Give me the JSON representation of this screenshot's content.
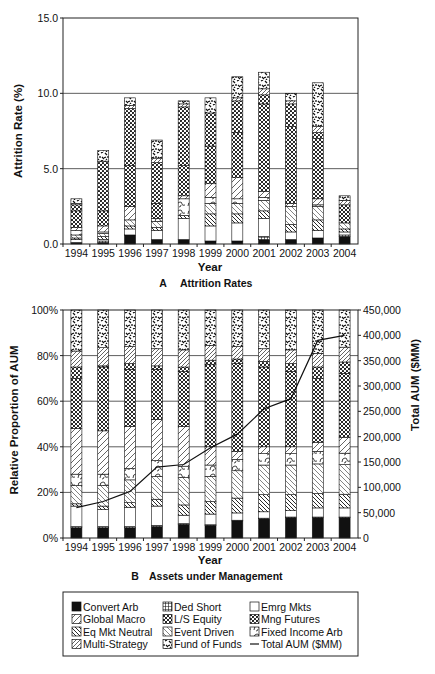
{
  "panels": {
    "a": {
      "letter": "A",
      "caption": "Attrition Rates",
      "xlabel": "Year",
      "ylabel": "Attrition Rate (%)"
    },
    "b": {
      "letter": "B",
      "caption": "Assets under Management",
      "xlabel": "Year",
      "ylabel_left": "Relative Proportion of AUM",
      "ylabel_right": "Total AUM ($MM)"
    }
  },
  "legend": {
    "items": [
      {
        "label": "Convert Arb",
        "pattern": "solid-black"
      },
      {
        "label": "Ded Short",
        "pattern": "grid"
      },
      {
        "label": "Emrg Mkts",
        "pattern": "blank"
      },
      {
        "label": "Global Macro",
        "pattern": "diag-sparse"
      },
      {
        "label": "L/S Equity",
        "pattern": "crosshatch"
      },
      {
        "label": "Mng Futures",
        "pattern": "dots"
      },
      {
        "label": "Eq Mkt Neutral",
        "pattern": "diag-back-dense"
      },
      {
        "label": "Event Driven",
        "pattern": "diag-back"
      },
      {
        "label": "Fixed Income Arb",
        "pattern": "waves"
      },
      {
        "label": "Multi-Strategy",
        "pattern": "diag-fwd"
      },
      {
        "label": "Fund of Funds",
        "pattern": "confetti"
      },
      {
        "label": "Total AUM ($MM)",
        "pattern": "line"
      }
    ]
  },
  "chart_data": [
    {
      "type": "bar",
      "stacked": true,
      "title": "A Attrition Rates",
      "xlabel": "Year",
      "ylabel": "Attrition Rate (%)",
      "ylim": [
        0,
        15
      ],
      "yticks": [
        "0.0",
        "5.0",
        "10.0",
        "15.0"
      ],
      "grid": "horizontal at 5.0 and 10.0",
      "categories": [
        "1994",
        "1995",
        "1996",
        "1997",
        "1998",
        "1999",
        "2000",
        "2001",
        "2002",
        "2003",
        "2004"
      ],
      "series": [
        {
          "name": "Convert Arb",
          "values": [
            0.1,
            0.1,
            0.6,
            0.3,
            0.3,
            0.2,
            0.2,
            0.3,
            0.3,
            0.4,
            0.5
          ]
        },
        {
          "name": "Ded Short",
          "values": [
            0.0,
            0.1,
            0.0,
            0.0,
            0.0,
            0.0,
            0.0,
            0.2,
            0.0,
            0.0,
            0.1
          ]
        },
        {
          "name": "Emrg Mkts",
          "values": [
            0.2,
            0.1,
            0.4,
            0.6,
            1.4,
            1.0,
            1.2,
            1.2,
            0.5,
            0.5,
            0.2
          ]
        },
        {
          "name": "Eq Mkt Neutral",
          "values": [
            0.1,
            0.2,
            0.2,
            0.2,
            0.2,
            0.8,
            0.6,
            0.5,
            0.5,
            0.7,
            0.2
          ]
        },
        {
          "name": "Event Driven",
          "values": [
            0.2,
            0.2,
            0.4,
            0.4,
            0.0,
            0.7,
            0.7,
            0.7,
            1.2,
            0.9,
            0.4
          ]
        },
        {
          "name": "Fixed Income Arb",
          "values": [
            0.3,
            0.1,
            0.0,
            0.2,
            1.1,
            0.4,
            0.3,
            0.2,
            0.0,
            0.1,
            0.0
          ]
        },
        {
          "name": "Global Macro",
          "values": [
            0.2,
            0.4,
            0.9,
            0.0,
            0.2,
            0.9,
            1.4,
            0.4,
            0.2,
            0.4,
            0.0
          ]
        },
        {
          "name": "L/S Equity",
          "values": [
            1.1,
            1.0,
            2.7,
            1.0,
            2.0,
            2.5,
            3.0,
            5.8,
            5.1,
            4.0,
            1.2
          ]
        },
        {
          "name": "Mng Futures",
          "values": [
            0.4,
            3.3,
            3.8,
            2.7,
            3.9,
            2.2,
            2.1,
            0.6,
            1.5,
            0.4,
            0.0
          ]
        },
        {
          "name": "Multi-Strategy",
          "values": [
            0.1,
            0.0,
            0.2,
            0.3,
            0.2,
            0.0,
            0.2,
            0.4,
            0.2,
            0.4,
            0.3
          ]
        },
        {
          "name": "Fund of Funds",
          "values": [
            0.3,
            0.7,
            0.5,
            1.2,
            0.2,
            1.0,
            1.4,
            1.1,
            0.5,
            2.9,
            0.3
          ]
        }
      ],
      "totals": [
        3.0,
        6.1,
        9.7,
        6.9,
        9.5,
        9.7,
        11.1,
        11.4,
        10.0,
        10.7,
        3.2
      ]
    },
    {
      "type": "bar",
      "stacked": true,
      "secondary_type": "line",
      "title": "B Assets under Management",
      "xlabel": "Year",
      "ylabel": "Relative Proportion of AUM",
      "ylabel_right": "Total AUM ($MM)",
      "ylim": [
        0,
        100
      ],
      "ylim_right": [
        0,
        450000
      ],
      "yticks": [
        "0%",
        "20%",
        "40%",
        "60%",
        "80%",
        "100%"
      ],
      "yticks_right": [
        "0",
        "50,000",
        "100,000",
        "150,000",
        "200,000",
        "250,000",
        "300,000",
        "350,000",
        "400,000",
        "450,000"
      ],
      "grid": "horizontal at 20%, 40%, 60%, 80%",
      "categories": [
        "1994",
        "1995",
        "1996",
        "1997",
        "1998",
        "1999",
        "2000",
        "2001",
        "2002",
        "2003",
        "2004"
      ],
      "series": [
        {
          "name": "Convert Arb",
          "values": [
            4.5,
            4.5,
            4.5,
            5.0,
            6.0,
            5.5,
            7.5,
            8.5,
            9.0,
            9.0,
            9.0
          ]
        },
        {
          "name": "Ded Short",
          "values": [
            0.5,
            0.5,
            0.5,
            0.5,
            0.3,
            0.3,
            0.3,
            0.2,
            0.2,
            0.2,
            0.2
          ]
        },
        {
          "name": "Emrg Mkts",
          "values": [
            9.0,
            7.5,
            8.5,
            8.5,
            3.7,
            4.7,
            3.2,
            2.8,
            2.8,
            4.0,
            4.0
          ]
        },
        {
          "name": "Eq Mkt Neutral",
          "values": [
            1.0,
            1.5,
            2.0,
            3.0,
            4.5,
            5.5,
            6.5,
            7.5,
            7.0,
            6.3,
            6.0
          ]
        },
        {
          "name": "Event Driven",
          "values": [
            8.0,
            9.0,
            10.0,
            10.0,
            12.0,
            11.0,
            12.0,
            13.0,
            13.0,
            13.0,
            13.0
          ]
        },
        {
          "name": "Fixed Income Arb",
          "values": [
            5.0,
            5.0,
            5.0,
            7.0,
            5.0,
            5.0,
            5.0,
            5.0,
            5.0,
            5.5,
            5.0
          ]
        },
        {
          "name": "Global Macro",
          "values": [
            20.0,
            19.0,
            18.5,
            18.0,
            17.5,
            8.0,
            3.5,
            3.0,
            3.0,
            4.0,
            7.0
          ]
        },
        {
          "name": "L/S Equity",
          "values": [
            22.0,
            28.0,
            25.0,
            22.0,
            24.0,
            36.0,
            38.5,
            35.0,
            33.0,
            28.0,
            28.0
          ]
        },
        {
          "name": "Mng Futures",
          "values": [
            5.0,
            0.5,
            2.5,
            1.5,
            2.0,
            2.0,
            2.0,
            2.5,
            3.5,
            5.0,
            5.0
          ]
        },
        {
          "name": "Multi-Strategy",
          "values": [
            7.0,
            8.0,
            7.5,
            7.5,
            7.5,
            6.5,
            5.5,
            5.5,
            6.0,
            6.0,
            6.5
          ]
        },
        {
          "name": "Fund of Funds",
          "values": [
            18.0,
            16.5,
            16.0,
            17.0,
            17.5,
            15.5,
            16.0,
            17.0,
            17.5,
            19.0,
            16.3
          ]
        }
      ],
      "line": {
        "name": "Total AUM ($MM)",
        "values": [
          60000,
          72000,
          92000,
          140000,
          145000,
          178000,
          205000,
          255000,
          275000,
          390000,
          400000
        ]
      }
    }
  ]
}
